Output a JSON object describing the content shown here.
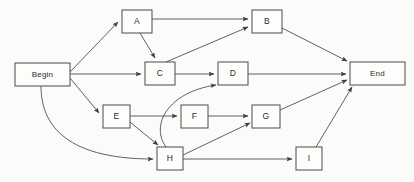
{
  "diagram": {
    "type": "directed-graph",
    "background_color": "#fbfbf9",
    "node_fill_color": "#fdfdfb",
    "node_stroke_color": "#4a4a4a",
    "edge_color": "#4f4f4f",
    "nodes": [
      {
        "id": "begin",
        "label": "Begin",
        "x": 15,
        "y": 63,
        "w": 55,
        "h": 23,
        "shape": "rect"
      },
      {
        "id": "a",
        "label": "A",
        "x": 122,
        "y": 10,
        "w": 30,
        "h": 23,
        "shape": "rect"
      },
      {
        "id": "b",
        "label": "B",
        "x": 252,
        "y": 10,
        "w": 30,
        "h": 23,
        "shape": "rect"
      },
      {
        "id": "c",
        "label": "C",
        "x": 145,
        "y": 62,
        "w": 30,
        "h": 23,
        "shape": "rect"
      },
      {
        "id": "d",
        "label": "D",
        "x": 218,
        "y": 62,
        "w": 30,
        "h": 23,
        "shape": "rect"
      },
      {
        "id": "e",
        "label": "E",
        "x": 103,
        "y": 105,
        "w": 27,
        "h": 23,
        "shape": "rect"
      },
      {
        "id": "f",
        "label": "F",
        "x": 181,
        "y": 105,
        "w": 27,
        "h": 23,
        "shape": "rect"
      },
      {
        "id": "g",
        "label": "G",
        "x": 252,
        "y": 105,
        "w": 28,
        "h": 23,
        "shape": "rect"
      },
      {
        "id": "h",
        "label": "H",
        "x": 157,
        "y": 147,
        "w": 26,
        "h": 23,
        "shape": "rect"
      },
      {
        "id": "i",
        "label": "I",
        "x": 296,
        "y": 147,
        "w": 26,
        "h": 23,
        "shape": "rect"
      },
      {
        "id": "end",
        "label": "End",
        "x": 350,
        "y": 62,
        "w": 55,
        "h": 23,
        "shape": "rect"
      }
    ],
    "edges": [
      {
        "from": "begin",
        "to": "a",
        "style": "straight",
        "path": "M 70,72 L 118,22"
      },
      {
        "from": "begin",
        "to": "c",
        "style": "straight",
        "path": "M 70,74 L 141,74"
      },
      {
        "from": "begin",
        "to": "e",
        "style": "straight",
        "path": "M 70,78 L 99,113"
      },
      {
        "from": "begin",
        "to": "h",
        "style": "curved",
        "path": "M 41,86 C 41,120 60,159 153,159"
      },
      {
        "from": "a",
        "to": "b",
        "style": "straight",
        "path": "M 152,19 L 248,19"
      },
      {
        "from": "a",
        "to": "c",
        "style": "straight",
        "path": "M 140,33 L 155,58"
      },
      {
        "from": "c",
        "to": "b",
        "style": "straight",
        "path": "M 166,62 L 248,27"
      },
      {
        "from": "c",
        "to": "d",
        "style": "straight",
        "path": "M 175,74 L 214,74"
      },
      {
        "from": "b",
        "to": "end",
        "style": "straight",
        "path": "M 282,28 L 347,61"
      },
      {
        "from": "d",
        "to": "end",
        "style": "straight",
        "path": "M 248,74 L 346,74"
      },
      {
        "from": "e",
        "to": "f",
        "style": "straight",
        "path": "M 130,116 L 177,116"
      },
      {
        "from": "e",
        "to": "h",
        "style": "straight",
        "path": "M 130,122 L 158,145"
      },
      {
        "from": "f",
        "to": "g",
        "style": "straight",
        "path": "M 208,116 L 248,116"
      },
      {
        "from": "h",
        "to": "d",
        "style": "curved",
        "path": "M 166,147 C 150,125 168,92 216,85"
      },
      {
        "from": "h",
        "to": "g",
        "style": "straight",
        "path": "M 183,155 L 250,123"
      },
      {
        "from": "h",
        "to": "i",
        "style": "straight",
        "path": "M 183,159 L 292,159"
      },
      {
        "from": "g",
        "to": "end",
        "style": "straight",
        "path": "M 280,110 L 347,80"
      },
      {
        "from": "i",
        "to": "end",
        "style": "straight",
        "path": "M 316,147 L 352,87"
      }
    ]
  }
}
